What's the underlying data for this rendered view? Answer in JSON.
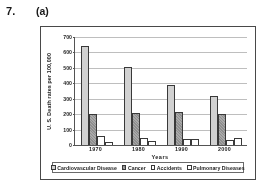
{
  "header": {
    "question_number": "7.",
    "part_label": "(a)"
  },
  "chart_data": {
    "type": "bar",
    "title": "",
    "xlabel": "Years",
    "ylabel": "U. S. Death rates per 100,000",
    "categories": [
      "1970",
      "1980",
      "1990",
      "2000"
    ],
    "series": [
      {
        "name": "Cardiovascular Disease",
        "values": [
          640,
          508,
          390,
          320
        ],
        "color": "#cfcfcf"
      },
      {
        "name": "Cancer",
        "values": [
          198,
          208,
          216,
          200
        ],
        "color": "#999999"
      },
      {
        "name": "Accidents",
        "values": [
          60,
          46,
          36,
          33
        ],
        "color": "#ffffff"
      },
      {
        "name": "Pulmonary Diseases",
        "values": [
          22,
          28,
          37,
          45
        ],
        "color": "#ffffff"
      }
    ],
    "ylim": [
      0,
      700
    ],
    "yticks": [
      0,
      100,
      200,
      300,
      400,
      500,
      600,
      700
    ],
    "ytick_labels": [
      "0",
      "100",
      "200",
      "300",
      "400",
      "500",
      "600",
      "700"
    ],
    "grid": true,
    "legend_position": "bottom"
  }
}
